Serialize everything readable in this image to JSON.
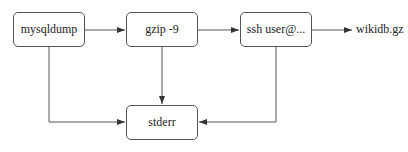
{
  "diagram": {
    "nodes": [
      {
        "id": "mysqldump",
        "label": "mysqldump"
      },
      {
        "id": "gzip",
        "label": "gzip -9"
      },
      {
        "id": "ssh",
        "label": "ssh user@..."
      },
      {
        "id": "stderr",
        "label": "stderr"
      }
    ],
    "output_label": "wikidb.gz",
    "edges": [
      {
        "from": "mysqldump",
        "to": "gzip"
      },
      {
        "from": "gzip",
        "to": "ssh"
      },
      {
        "from": "ssh",
        "to": "wikidb.gz"
      },
      {
        "from": "mysqldump",
        "to": "stderr"
      },
      {
        "from": "gzip",
        "to": "stderr"
      },
      {
        "from": "ssh",
        "to": "stderr"
      }
    ],
    "colors": {
      "stroke": "#555555",
      "text": "#222222",
      "background": "#ffffff"
    }
  }
}
